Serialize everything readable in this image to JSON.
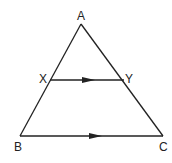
{
  "diagram": {
    "type": "geometry-triangle",
    "points": {
      "A": {
        "label": "A",
        "x": 81,
        "y": 24
      },
      "B": {
        "label": "B",
        "x": 20,
        "y": 136
      },
      "C": {
        "label": "C",
        "x": 163,
        "y": 136
      },
      "X": {
        "label": "X",
        "x": 50,
        "y": 80
      },
      "Y": {
        "label": "Y",
        "x": 124,
        "y": 80
      }
    },
    "parallel_segments": [
      "XY",
      "BC"
    ],
    "stroke_color": "#222222"
  }
}
